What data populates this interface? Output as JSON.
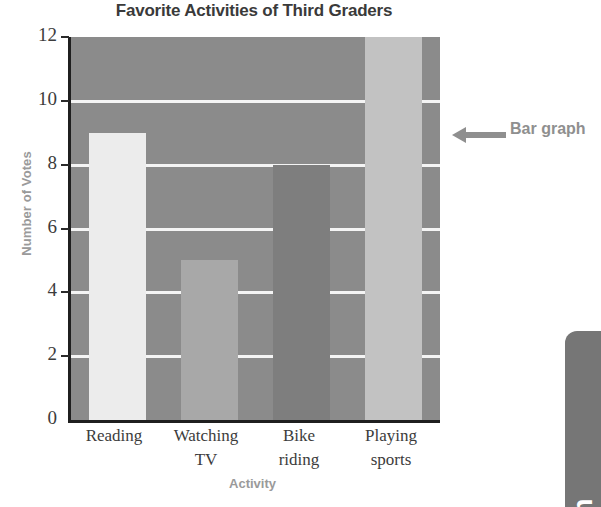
{
  "chart_data": {
    "type": "bar",
    "title": "Favorite Activities of Third Graders",
    "xlabel": "Activity",
    "ylabel": "Number of Votes",
    "categories": [
      "Reading",
      "Watching TV",
      "Bike riding",
      "Playing sports"
    ],
    "category_lines": [
      [
        "Reading"
      ],
      [
        "Watching",
        "TV"
      ],
      [
        "Bike",
        "riding"
      ],
      [
        "Playing",
        "sports"
      ]
    ],
    "values": [
      9,
      5,
      8,
      12
    ],
    "ylim": [
      0,
      12
    ],
    "yticks": [
      0,
      2,
      4,
      6,
      8,
      10,
      12
    ],
    "ytick_labels": [
      "0",
      "2",
      "4",
      "6",
      "8",
      "10",
      "12"
    ],
    "grid": true,
    "gridlines_at": [
      2,
      4,
      6,
      8,
      10
    ],
    "legend": "none",
    "bar_colors": [
      "#ececec",
      "#a8a8a8",
      "#7e7e7e",
      "#c2c2c2"
    ],
    "plot_background": "#8b8b8b",
    "axis_color": "#1f1f1f",
    "gridline_color": "#f4f4f4"
  },
  "callout": {
    "text": "Bar graph",
    "arrow_direction": "left",
    "color": "#8f8f8f"
  },
  "side_tab": {
    "label": "Math",
    "background": "#767676",
    "text_color": "#ffffff"
  }
}
